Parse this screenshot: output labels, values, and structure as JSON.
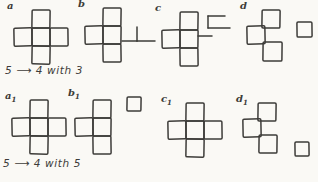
{
  "page": {
    "background_color": "#faf9f5",
    "ink_color": "#3d3c39"
  },
  "rows": [
    {
      "caption": "5 ⟶ 4 with 3",
      "figures": [
        {
          "label": "a",
          "sub": "",
          "pos": [
            14,
            10
          ],
          "squares": [
            [
              18,
              0,
              18
            ],
            [
              0,
              18,
              18
            ],
            [
              18,
              18,
              18
            ],
            [
              36,
              18,
              18
            ],
            [
              18,
              36,
              18
            ]
          ]
        },
        {
          "label": "b",
          "sub": "",
          "pos": [
            85,
            8
          ],
          "squares": [
            [
              18,
              0,
              18
            ],
            [
              0,
              18,
              18
            ],
            [
              18,
              18,
              18
            ],
            [
              18,
              36,
              18
            ]
          ],
          "sticks": [
            [
              37,
              33,
              52,
              33
            ],
            [
              52,
              19,
              52,
              33
            ],
            [
              52,
              33,
              70,
              33
            ]
          ]
        },
        {
          "label": "c",
          "sub": "",
          "pos": [
            162,
            12
          ],
          "squares": [
            [
              18,
              0,
              18
            ],
            [
              0,
              18,
              18
            ],
            [
              18,
              18,
              18
            ],
            [
              18,
              36,
              18
            ]
          ],
          "sticks": [
            [
              36,
              24,
              50,
              24
            ],
            [
              46,
              4,
              46,
              16
            ],
            [
              46,
              4,
              63,
              4
            ],
            [
              46,
              16,
              68,
              16
            ]
          ]
        },
        {
          "label": "d",
          "sub": "",
          "pos": [
            247,
            10
          ],
          "squares": [
            [
              15,
              0,
              18
            ],
            [
              0,
              16,
              18
            ],
            [
              16,
              32,
              19
            ]
          ],
          "detached": [
            [
              50,
              12,
              15
            ]
          ]
        }
      ]
    },
    {
      "caption": "5 ⟶ 4 with 5",
      "figures": [
        {
          "label": "a",
          "sub": "1",
          "pos": [
            12,
            100
          ],
          "squares": [
            [
              18,
              0,
              18
            ],
            [
              0,
              18,
              18
            ],
            [
              18,
              18,
              18
            ],
            [
              36,
              18,
              18
            ],
            [
              18,
              36,
              18
            ]
          ]
        },
        {
          "label": "b",
          "sub": "1",
          "pos": [
            75,
            97
          ],
          "squares": [
            [
              18,
              3,
              18
            ],
            [
              0,
              21,
              18
            ],
            [
              18,
              21,
              18
            ],
            [
              18,
              39,
              18
            ]
          ],
          "detached": [
            [
              52,
              0,
              14
            ]
          ]
        },
        {
          "label": "c",
          "sub": "1",
          "pos": [
            168,
            103
          ],
          "squares": [
            [
              18,
              0,
              18
            ],
            [
              0,
              18,
              18
            ],
            [
              18,
              18,
              18
            ],
            [
              36,
              18,
              18
            ],
            [
              18,
              36,
              18
            ]
          ]
        },
        {
          "label": "d",
          "sub": "1",
          "pos": [
            243,
            103
          ],
          "squares": [
            [
              15,
              0,
              18
            ],
            [
              0,
              16,
              18
            ],
            [
              16,
              32,
              18
            ]
          ],
          "detached": [
            [
              52,
              39,
              14
            ]
          ]
        }
      ]
    }
  ]
}
